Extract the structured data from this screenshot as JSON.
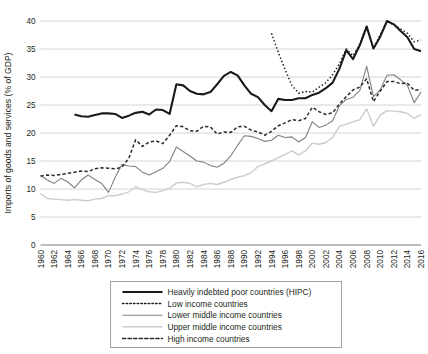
{
  "chart_data": {
    "type": "line",
    "title": "",
    "xlabel": "",
    "ylabel": "Imports of goods and services (% of GDP)",
    "ylim": [
      0,
      40
    ],
    "yticks": [
      0,
      5,
      10,
      15,
      20,
      25,
      30,
      35,
      40
    ],
    "grid": true,
    "legend_position": "bottom",
    "x": [
      1960,
      1961,
      1962,
      1963,
      1964,
      1965,
      1966,
      1967,
      1968,
      1969,
      1970,
      1971,
      1972,
      1973,
      1974,
      1975,
      1976,
      1977,
      1978,
      1979,
      1980,
      1981,
      1982,
      1983,
      1984,
      1985,
      1986,
      1987,
      1988,
      1989,
      1990,
      1991,
      1992,
      1993,
      1994,
      1995,
      1996,
      1997,
      1998,
      1999,
      2000,
      2001,
      2002,
      2003,
      2004,
      2005,
      2006,
      2007,
      2008,
      2009,
      2010,
      2011,
      2012,
      2013,
      2014,
      2015,
      2016
    ],
    "xticks": [
      "1960",
      "1962",
      "1964",
      "1966",
      "1968",
      "1970",
      "1972",
      "1974",
      "1976",
      "1978",
      "1980",
      "1982",
      "1984",
      "1986",
      "1988",
      "1990",
      "1992",
      "1994",
      "1996",
      "1998",
      "2000",
      "2002",
      "2004",
      "2006",
      "2008",
      "2010",
      "2012",
      "2014",
      "2016"
    ],
    "series": [
      {
        "name": "Heavily indebted poor countries (HIPC)",
        "style": "solid",
        "color": "#1a1a1a",
        "width": 2.1,
        "values": [
          null,
          null,
          null,
          null,
          null,
          23.3,
          23.0,
          22.9,
          23.2,
          23.5,
          23.5,
          23.4,
          22.7,
          23.1,
          23.6,
          23.8,
          23.3,
          24.2,
          24.1,
          23.4,
          28.7,
          28.5,
          27.5,
          27.0,
          26.9,
          27.3,
          28.7,
          30.2,
          30.9,
          30.3,
          28.5,
          27.0,
          26.4,
          25.0,
          23.9,
          26.1,
          25.9,
          25.9,
          26.2,
          26.2,
          26.8,
          27.2,
          28.0,
          29.0,
          31.5,
          34.8,
          33.2,
          35.7,
          39.0,
          35.1,
          37.2,
          40.0,
          39.4,
          38.2,
          37.1,
          35.0,
          34.6
        ]
      },
      {
        "name": "Low income countries",
        "style": "dotted",
        "color": "#1a1a1a",
        "width": 1.5,
        "values": [
          null,
          null,
          null,
          null,
          null,
          null,
          null,
          null,
          null,
          null,
          null,
          null,
          null,
          null,
          null,
          null,
          null,
          null,
          null,
          null,
          null,
          null,
          null,
          null,
          null,
          null,
          null,
          null,
          null,
          null,
          null,
          null,
          null,
          null,
          37.8,
          34.4,
          31.3,
          28.5,
          27.1,
          27.4,
          27.3,
          28.2,
          29.0,
          30.4,
          32.4,
          35.0,
          33.8,
          35.8,
          39.2,
          35.0,
          37.6,
          39.9,
          39.3,
          38.6,
          37.8,
          36.3,
          36.6
        ]
      },
      {
        "name": "Lower middle income countries",
        "style": "solid",
        "color": "#808080",
        "width": 1.1,
        "values": [
          12.4,
          11.6,
          11.0,
          11.9,
          11.3,
          10.2,
          11.6,
          12.5,
          11.7,
          11.0,
          9.4,
          12.1,
          14.4,
          14.1,
          14.0,
          13.0,
          12.5,
          13.1,
          13.7,
          14.9,
          17.5,
          16.7,
          15.9,
          15.0,
          14.8,
          14.2,
          13.9,
          14.6,
          15.9,
          17.8,
          19.5,
          19.4,
          19.0,
          18.5,
          18.7,
          19.6,
          19.2,
          19.3,
          18.4,
          19.2,
          22.0,
          21.0,
          21.4,
          22.2,
          24.9,
          26.0,
          26.4,
          27.6,
          31.9,
          26.5,
          27.7,
          30.3,
          30.4,
          29.5,
          28.5,
          25.4,
          27.3
        ]
      },
      {
        "name": "Upper middle income countries",
        "style": "solid",
        "color": "#cccccc",
        "width": 1.4,
        "values": [
          9.2,
          8.3,
          8.2,
          8.1,
          8.0,
          8.1,
          8.0,
          7.9,
          8.2,
          8.3,
          8.8,
          8.8,
          9.1,
          9.5,
          10.4,
          9.9,
          9.5,
          9.4,
          9.7,
          10.1,
          11.1,
          11.2,
          11.0,
          10.4,
          10.8,
          11.0,
          10.8,
          11.2,
          11.7,
          12.1,
          12.4,
          12.9,
          14.0,
          14.5,
          15.0,
          15.6,
          16.2,
          16.8,
          16.1,
          16.8,
          18.2,
          18.0,
          18.3,
          19.2,
          21.2,
          21.6,
          22.0,
          22.4,
          24.3,
          21.2,
          23.2,
          24.0,
          23.9,
          23.8,
          23.5,
          22.6,
          23.3
        ]
      },
      {
        "name": "High income countries",
        "style": "dashed",
        "color": "#2b2b2b",
        "width": 1.5,
        "values": [
          12.3,
          12.5,
          12.4,
          12.6,
          12.8,
          13.0,
          13.2,
          13.1,
          13.6,
          13.8,
          13.7,
          13.6,
          13.9,
          15.5,
          18.8,
          17.6,
          18.4,
          18.6,
          18.1,
          19.6,
          21.3,
          21.1,
          20.4,
          20.3,
          21.2,
          21.1,
          19.8,
          20.2,
          20.1,
          21.1,
          21.2,
          20.5,
          20.2,
          19.6,
          20.3,
          21.3,
          21.8,
          22.4,
          22.2,
          22.6,
          24.6,
          23.8,
          23.3,
          23.6,
          25.2,
          26.5,
          27.7,
          28.2,
          29.7,
          25.6,
          27.5,
          29.2,
          29.2,
          28.8,
          28.9,
          27.6,
          27.8
        ]
      }
    ]
  },
  "legend": {
    "entries": [
      {
        "label": "Heavily indebted poor countries (HIPC)"
      },
      {
        "label": "Low income countries"
      },
      {
        "label": "Lower middle income countries"
      },
      {
        "label": "Upper middle income countries"
      },
      {
        "label": "High income countries"
      }
    ]
  }
}
